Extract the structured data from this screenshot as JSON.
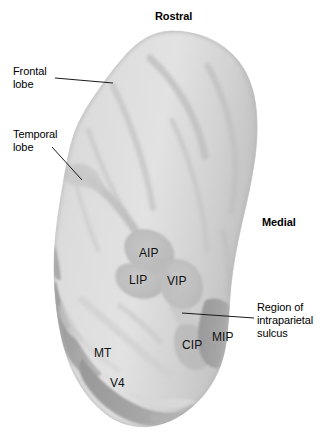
{
  "figure": {
    "background_color": "#ffffff",
    "width": 328,
    "height": 434
  },
  "orientation_labels": [
    {
      "id": "rostral",
      "text": "Rostral",
      "x": 155,
      "y": 10,
      "bold": true
    },
    {
      "id": "medial",
      "text": "Medial",
      "x": 262,
      "y": 216,
      "bold": true
    }
  ],
  "callouts": [
    {
      "id": "frontal-lobe",
      "text": "Frontal\nlobe",
      "x": 13,
      "y": 65,
      "leader": {
        "x1": 55,
        "y1": 78,
        "x2": 113,
        "y2": 83
      }
    },
    {
      "id": "temporal-lobe",
      "text": "Temporal\nlobe",
      "x": 13,
      "y": 128,
      "leader": {
        "x1": 52,
        "y1": 147,
        "x2": 82,
        "y2": 180
      }
    },
    {
      "id": "intraparietal-sulcus",
      "text": "Region of\nintraparietal\nsulcus",
      "x": 257,
      "y": 301,
      "leader": {
        "x1": 182,
        "y1": 313,
        "x2": 254,
        "y2": 318
      }
    }
  ],
  "cortical_regions": [
    {
      "id": "AIP",
      "label": "AIP",
      "x": 139,
      "y": 247
    },
    {
      "id": "LIP",
      "label": "LIP",
      "x": 129,
      "y": 274
    },
    {
      "id": "VIP",
      "label": "VIP",
      "x": 167,
      "y": 275
    },
    {
      "id": "CIP",
      "label": "CIP",
      "x": 182,
      "y": 339
    },
    {
      "id": "MIP",
      "label": "MIP",
      "x": 212,
      "y": 331
    },
    {
      "id": "MT",
      "label": "MT",
      "x": 94,
      "y": 347
    },
    {
      "id": "V4",
      "label": "V4",
      "x": 110,
      "y": 377
    }
  ],
  "colors": {
    "background": "#ffffff",
    "cortex_light": "#dcdcdc",
    "cortex_midlight": "#d2d2d2",
    "cortex_mid": "#c4c4c4",
    "cortex_patch": "#bdbdbd",
    "cortex_dark": "#9e9e9e",
    "cortex_darker": "#8f8f8f",
    "sulcus_shadow": "#b6b6b6",
    "outline": "#b0b0b0",
    "text": "#000000",
    "leader_line": "#1a1a1a"
  }
}
